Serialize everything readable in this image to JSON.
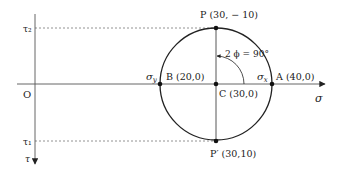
{
  "diagram": {
    "type": "mohr-circle",
    "axes": {
      "sigma_label": "σ",
      "tau_label": "τ",
      "origin_label": "O",
      "tau2_label": "τ₂",
      "tau1_label": "τ₁"
    },
    "points": {
      "P": "P (30, − 10)",
      "P_prime": "P′ (30,10)",
      "A": "A (40,0)",
      "B": "B (20,0)",
      "C": "C (30,0)"
    },
    "stress_labels": {
      "sigma_x": "σx",
      "sigma_y": "σy"
    },
    "angle_label": "2 ϕ = 90°",
    "colors": {
      "line": "#222222",
      "axis": "#555555",
      "dotted": "#777777"
    }
  }
}
